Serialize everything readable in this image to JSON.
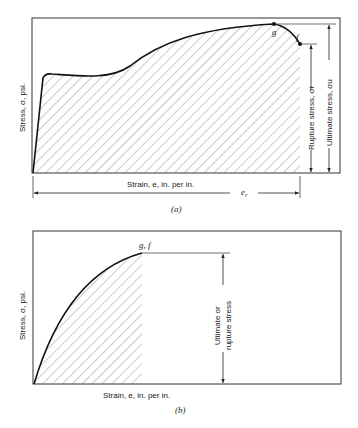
{
  "panel_a": {
    "caption": "(a)",
    "y_axis_label": "Stress, σ, psi.",
    "x_axis_label": "Strain, e, in. per in.",
    "point_g_label": "g",
    "point_f_label": "f",
    "rupture_label": "Rupture stress, σr",
    "ultimate_label": "Ultimate stress, σu",
    "rupture_strain_label": "e",
    "rupture_strain_sub": "r"
  },
  "panel_b": {
    "caption": "(b)",
    "y_axis_label": "Stress, σ, psi.",
    "x_axis_label": "Strain, e, in. per in.",
    "point_gf_label": "g, f",
    "stress_label_line1": "Ultimate or",
    "stress_label_line2": "rupture stress"
  },
  "colors": {
    "line": "#222222",
    "hatch": "#555555",
    "background": "#ffffff"
  }
}
